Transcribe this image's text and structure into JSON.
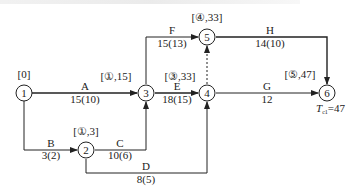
{
  "diagram": {
    "type": "double-code network (activity-on-arrow) with critical path labels",
    "nodes": [
      {
        "id": "1",
        "label": "1",
        "x": 24,
        "y": 93,
        "tag": "[0]"
      },
      {
        "id": "2",
        "label": "2",
        "x": 86,
        "y": 150,
        "tag": "[①,3]"
      },
      {
        "id": "3",
        "label": "3",
        "x": 146,
        "y": 93,
        "tag": "[①,15]"
      },
      {
        "id": "4",
        "label": "4",
        "x": 207,
        "y": 93,
        "tag": "[③,33]"
      },
      {
        "id": "5",
        "label": "5",
        "x": 207,
        "y": 37,
        "tag": "[④,33]"
      },
      {
        "id": "6",
        "label": "6",
        "x": 327,
        "y": 93,
        "tag": "[⑤,47]"
      }
    ],
    "activities": [
      {
        "name": "A",
        "from": "1",
        "to": "3",
        "duration": "15(10)"
      },
      {
        "name": "B",
        "from": "1",
        "to": "2",
        "duration": "3(2)"
      },
      {
        "name": "C",
        "from": "2",
        "to": "3",
        "duration": "10(6)"
      },
      {
        "name": "D",
        "from": "2",
        "to": "4",
        "duration": "8(5)"
      },
      {
        "name": "E",
        "from": "3",
        "to": "4",
        "duration": "18(15)"
      },
      {
        "name": "F",
        "from": "3",
        "to": "5",
        "duration": "15(13)"
      },
      {
        "name": "G",
        "from": "4",
        "to": "6",
        "duration": "12"
      },
      {
        "name": "H",
        "from": "5",
        "to": "6",
        "duration": "14(10)"
      },
      {
        "name": "",
        "from": "4",
        "to": "5",
        "duration": "",
        "dummy": true
      }
    ],
    "result": {
      "symbol": "T",
      "subscript": "c1",
      "value": "=47"
    }
  },
  "labels": {
    "tag1": "[0]",
    "tag2": "[①,3]",
    "tag3": "[①,15]",
    "tag4": "[③,33]",
    "tag5": "[④,33]",
    "tag6": "[⑤,47]",
    "n1": "1",
    "n2": "2",
    "n3": "3",
    "n4": "4",
    "n5": "5",
    "n6": "6",
    "A": "A",
    "A_d": "15(10)",
    "B": "B",
    "B_d": "3(2)",
    "C": "C",
    "C_d": "10(6)",
    "D": "D",
    "D_d": "8(5)",
    "E": "E",
    "E_d": "18(15)",
    "F": "F",
    "F_d": "15(13)",
    "G": "G",
    "G_d": "12",
    "H": "H",
    "H_d": "14(10)",
    "tc_T": "T",
    "tc_sub": "c1",
    "tc_val": "=47"
  },
  "colors": {
    "line": "#222222",
    "background": "#ffffff"
  }
}
